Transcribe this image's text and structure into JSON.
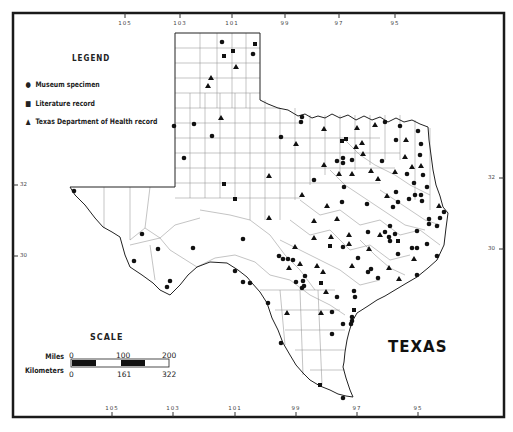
{
  "map": {
    "state_name": "TEXAS",
    "legend": {
      "title": "LEGEND",
      "items": [
        {
          "symbol": "circle",
          "label": "Museum specimen"
        },
        {
          "symbol": "square",
          "label": "Literature record"
        },
        {
          "symbol": "triangle",
          "label": "Texas Department of Health record"
        }
      ]
    },
    "scale": {
      "title": "SCALE",
      "miles_label": "Miles",
      "kilometers_label": "Kilometers",
      "miles_ticks": [
        "0",
        "100",
        "200"
      ],
      "km_ticks": [
        "0",
        "161",
        "322"
      ]
    },
    "longitude_ticks_top": [
      "105",
      "103",
      "101",
      "99",
      "97",
      "95"
    ],
    "longitude_ticks_bottom": [
      "105",
      "103",
      "101",
      "99",
      "97",
      "95"
    ],
    "latitude_ticks_left": [
      "32",
      "30"
    ],
    "latitude_ticks_right": [
      "32",
      "30"
    ]
  }
}
